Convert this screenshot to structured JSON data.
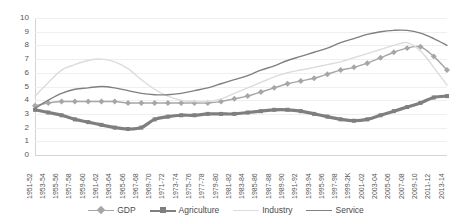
{
  "chart_data": {
    "type": "line",
    "title": "",
    "xlabel": "",
    "ylabel": "",
    "ylim": [
      0,
      10
    ],
    "ytick_step": 1,
    "grid": true,
    "legend_position": "bottom",
    "categories": [
      "1951-52",
      "1953-54",
      "1955-56",
      "1957-58",
      "1959-60",
      "1961-62",
      "1963-64",
      "1965-66",
      "1967-68",
      "1969-70",
      "1971-72",
      "1973-74",
      "1975-76",
      "1977-78",
      "1979-80",
      "1981-82",
      "1983-84",
      "1985-86",
      "1987-88",
      "1989-90",
      "1991-92",
      "1993-94",
      "1995-96",
      "1997-98",
      "1999-2K",
      "2001-02",
      "2003-04",
      "2005-06",
      "2007-08",
      "2009-10",
      "2011-12",
      "2013-14"
    ],
    "yticks": [
      "0",
      "1",
      "2",
      "3",
      "4",
      "5",
      "6",
      "7",
      "8",
      "9",
      "10"
    ],
    "series": [
      {
        "name": "GDP",
        "color": "#a6a6a6",
        "marker": "diamond",
        "values": [
          3.6,
          3.8,
          3.9,
          3.9,
          3.9,
          3.9,
          3.9,
          3.8,
          3.8,
          3.8,
          3.8,
          3.8,
          3.8,
          3.8,
          3.9,
          4.1,
          4.3,
          4.6,
          4.9,
          5.2,
          5.4,
          5.6,
          5.9,
          6.2,
          6.4,
          6.7,
          7.1,
          7.5,
          7.8,
          7.9,
          7.2,
          6.2
        ]
      },
      {
        "name": "Agriculture",
        "color": "#7f7f7f",
        "marker": "square",
        "values": [
          3.3,
          3.1,
          2.9,
          2.6,
          2.4,
          2.2,
          2.0,
          1.9,
          2.0,
          2.6,
          2.8,
          2.9,
          2.9,
          3.0,
          3.0,
          3.0,
          3.1,
          3.2,
          3.3,
          3.3,
          3.2,
          3.0,
          2.8,
          2.6,
          2.5,
          2.6,
          2.9,
          3.2,
          3.5,
          3.8,
          4.2,
          4.3
        ]
      },
      {
        "name": "Industry",
        "color": "#dcdcdc",
        "marker": "none",
        "values": [
          4.3,
          5.3,
          6.2,
          6.6,
          6.9,
          7.0,
          6.8,
          6.3,
          5.5,
          4.8,
          4.3,
          4.0,
          3.9,
          3.9,
          4.1,
          4.5,
          4.9,
          5.3,
          5.7,
          6.0,
          6.2,
          6.4,
          6.6,
          6.8,
          7.1,
          7.4,
          7.7,
          8.0,
          8.2,
          7.6,
          6.4,
          5.1
        ]
      },
      {
        "name": "Service",
        "color": "#808080",
        "marker": "none",
        "values": [
          3.4,
          4.0,
          4.5,
          4.8,
          4.9,
          5.0,
          4.9,
          4.7,
          4.5,
          4.4,
          4.4,
          4.5,
          4.7,
          4.9,
          5.2,
          5.5,
          5.8,
          6.2,
          6.5,
          6.9,
          7.2,
          7.5,
          7.8,
          8.2,
          8.5,
          8.8,
          9.0,
          9.1,
          9.1,
          8.9,
          8.5,
          8.0
        ]
      }
    ]
  },
  "legend": {
    "items": [
      {
        "label": "GDP"
      },
      {
        "label": "Agriculture"
      },
      {
        "label": "Industry"
      },
      {
        "label": "Service"
      }
    ]
  }
}
